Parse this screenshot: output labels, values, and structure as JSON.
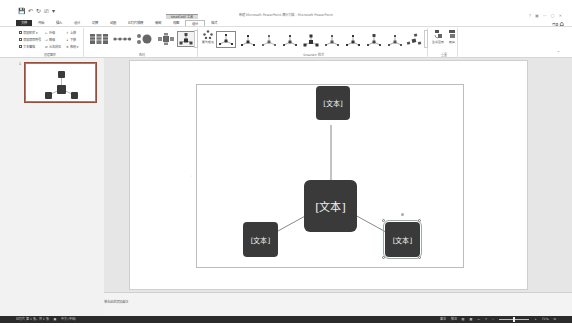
{
  "window": {
    "title": "新建 Microsoft PowerPoint 演示文稿 - Microsoft PowerPoint",
    "controls": [
      "?",
      "▣",
      "—",
      "▢",
      "✕"
    ],
    "user_name": "登录"
  },
  "quick_access": {
    "save_icon": "💾",
    "undo_icon": "↶",
    "redo_icon": "↻",
    "start_icon": "⎚",
    "more_icon": "▾"
  },
  "contextual_tab_group": "SMARTART 工具",
  "tabs": [
    {
      "label": "文件",
      "type": "file"
    },
    {
      "label": "开始"
    },
    {
      "label": "插入"
    },
    {
      "label": "设计"
    },
    {
      "label": "切换"
    },
    {
      "label": "动画"
    },
    {
      "label": "幻灯片放映"
    },
    {
      "label": "审阅"
    },
    {
      "label": "视图"
    },
    {
      "label": "设计",
      "active": true
    },
    {
      "label": "格式"
    }
  ],
  "ribbon": {
    "create_graphic": {
      "label": "创建图形",
      "commands": [
        {
          "label": "添加形状 ▾"
        },
        {
          "label": "添加项目符号"
        },
        {
          "label": "文本窗格"
        },
        {
          "label": "升级"
        },
        {
          "label": "降级"
        },
        {
          "label": "从右向左"
        },
        {
          "label": "上移"
        },
        {
          "label": "下移"
        },
        {
          "label": "布局 ▾"
        }
      ]
    },
    "layouts": {
      "label": "布局",
      "items": [
        "vertical-list-layout",
        "process-layout",
        "cycle-layout",
        "hierarchy-layout",
        "radial-layout"
      ],
      "selected_index": 4
    },
    "smartart_styles": {
      "label": "SmartArt 样式",
      "change_colors_label": "更改颜色",
      "style_count": 11,
      "selected_index": 0
    },
    "reset": {
      "label": "重置",
      "reset_graphic_label": "重设图形",
      "convert_label": "转换"
    },
    "collapse_icon": "⌃"
  },
  "thumbnails": [
    {
      "number": "1"
    }
  ],
  "smartart": {
    "nodes": [
      {
        "id": "top",
        "text": "[文本]"
      },
      {
        "id": "center",
        "text": "[文本]"
      },
      {
        "id": "bottom-left",
        "text": "[文本]"
      },
      {
        "id": "bottom-right",
        "text": "[文本]",
        "selected": true
      }
    ]
  },
  "notes": {
    "placeholder": "单击此处添加备注"
  },
  "statusbar": {
    "slide_info": "幻灯片 第 1 张，共 1 张",
    "language": "中文(中国)",
    "notes_label": "备注",
    "comments_label": "批注",
    "zoom_value": "71%"
  },
  "colors": {
    "node_fill": "#3a3a3a",
    "node_text": "#f2f2f2",
    "file_tab": "#2f2f2f",
    "statusbar": "#2b2b2b",
    "workspace": "#e6e6e6",
    "thumb_selection": "#c43e1c"
  }
}
